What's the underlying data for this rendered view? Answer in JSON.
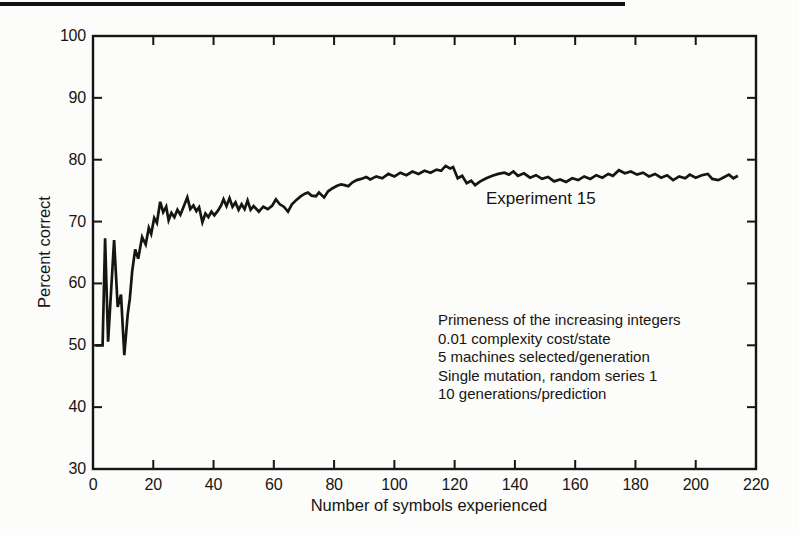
{
  "figure": {
    "ink_color": "#171513",
    "background_color": "#fcfcfa",
    "top_rule_color": "#101010"
  },
  "chart_data": {
    "type": "line",
    "title": "",
    "series_label": "Experiment 15",
    "xlabel": "Number of symbols experienced",
    "ylabel": "Percent correct",
    "xlim": [
      0,
      220
    ],
    "ylim": [
      30,
      100
    ],
    "x_ticks": [
      0,
      20,
      40,
      60,
      80,
      100,
      120,
      140,
      160,
      180,
      200,
      220
    ],
    "y_ticks": [
      30,
      40,
      50,
      60,
      70,
      80,
      90,
      100
    ],
    "grid": false,
    "legend": "none",
    "line_color": "#171513",
    "annotations": [
      "Primeness of the increasing integers",
      "0.01 complexity cost/state",
      "5 machines selected/generation",
      "Single mutation, random series 1",
      "10 generations/prediction"
    ],
    "series": [
      {
        "name": "Experiment 15",
        "points": [
          [
            0.8,
            50
          ],
          [
            3.2,
            50
          ],
          [
            4,
            67.3
          ],
          [
            5,
            50.6
          ],
          [
            7,
            67
          ],
          [
            8.2,
            56.2
          ],
          [
            9.3,
            58.2
          ],
          [
            10.4,
            48.4
          ],
          [
            11.5,
            55
          ],
          [
            12.2,
            57.5
          ],
          [
            13,
            62
          ],
          [
            14,
            65.5
          ],
          [
            15,
            64
          ],
          [
            16.3,
            67.5
          ],
          [
            17.5,
            66.3
          ],
          [
            18.5,
            69
          ],
          [
            19.3,
            68
          ],
          [
            20.3,
            70.6
          ],
          [
            21.2,
            69.8
          ],
          [
            22.3,
            73.2
          ],
          [
            23.3,
            71.5
          ],
          [
            24.3,
            72.4
          ],
          [
            25.1,
            70.2
          ],
          [
            26,
            71.4
          ],
          [
            27,
            70.7
          ],
          [
            28,
            71.9
          ],
          [
            29,
            71.1
          ],
          [
            30,
            72.3
          ],
          [
            31.3,
            73.9
          ],
          [
            32.3,
            72
          ],
          [
            33.3,
            72.6
          ],
          [
            34.3,
            71.7
          ],
          [
            35.2,
            72.3
          ],
          [
            36.3,
            69.9
          ],
          [
            37.3,
            71.3
          ],
          [
            38.3,
            70.7
          ],
          [
            39.3,
            71.6
          ],
          [
            40.3,
            71
          ],
          [
            41.5,
            71.8
          ],
          [
            42.5,
            72.6
          ],
          [
            43.3,
            73.6
          ],
          [
            44.3,
            72.5
          ],
          [
            45.3,
            73.8
          ],
          [
            46.3,
            72.4
          ],
          [
            47.3,
            73.1
          ],
          [
            48.3,
            71.9
          ],
          [
            49.3,
            72.8
          ],
          [
            50.3,
            72
          ],
          [
            51.3,
            73.4
          ],
          [
            52.3,
            71.9
          ],
          [
            53.3,
            72.5
          ],
          [
            54.3,
            72
          ],
          [
            55,
            71.6
          ],
          [
            56.5,
            72.4
          ],
          [
            58,
            72
          ],
          [
            59.5,
            72.6
          ],
          [
            60.7,
            73.6
          ],
          [
            62,
            72.8
          ],
          [
            63.3,
            72.4
          ],
          [
            64.7,
            71.6
          ],
          [
            66,
            72.8
          ],
          [
            67.5,
            73.5
          ],
          [
            69,
            74.1
          ],
          [
            70.3,
            74.5
          ],
          [
            71.3,
            74.7
          ],
          [
            72.5,
            74.2
          ],
          [
            74,
            74.1
          ],
          [
            75,
            74.7
          ],
          [
            76.7,
            73.9
          ],
          [
            78,
            74.9
          ],
          [
            79.5,
            75.4
          ],
          [
            81,
            75.8
          ],
          [
            82.3,
            76
          ],
          [
            83.5,
            75.9
          ],
          [
            84.7,
            75.7
          ],
          [
            86,
            76.3
          ],
          [
            87.5,
            76.7
          ],
          [
            89,
            76.9
          ],
          [
            90.7,
            77.2
          ],
          [
            92,
            76.8
          ],
          [
            94,
            77.3
          ],
          [
            96,
            77
          ],
          [
            98,
            77.7
          ],
          [
            100,
            77.3
          ],
          [
            102,
            77.9
          ],
          [
            104,
            77.5
          ],
          [
            106,
            78.1
          ],
          [
            108,
            77.7
          ],
          [
            110,
            78.2
          ],
          [
            112,
            77.9
          ],
          [
            114,
            78.4
          ],
          [
            115.5,
            78.2
          ],
          [
            117,
            79
          ],
          [
            118.5,
            78.6
          ],
          [
            119.5,
            78.8
          ],
          [
            121,
            77
          ],
          [
            122.5,
            77.4
          ],
          [
            124,
            76.2
          ],
          [
            125.5,
            76.6
          ],
          [
            126.8,
            75.9
          ],
          [
            128.5,
            76.5
          ],
          [
            130.5,
            77
          ],
          [
            132.5,
            77.4
          ],
          [
            134.5,
            77.7
          ],
          [
            136.5,
            77.9
          ],
          [
            138,
            77.6
          ],
          [
            139.5,
            78.1
          ],
          [
            141,
            77.4
          ],
          [
            143,
            77.8
          ],
          [
            145,
            77.1
          ],
          [
            147,
            77.5
          ],
          [
            149,
            76.9
          ],
          [
            151,
            77.2
          ],
          [
            153,
            76.5
          ],
          [
            155,
            76.8
          ],
          [
            157,
            76.4
          ],
          [
            159,
            77
          ],
          [
            161,
            76.7
          ],
          [
            163,
            77.3
          ],
          [
            165,
            76.9
          ],
          [
            167,
            77.5
          ],
          [
            169,
            77.1
          ],
          [
            171,
            77.7
          ],
          [
            172.5,
            77.4
          ],
          [
            174.5,
            78.3
          ],
          [
            176.5,
            77.8
          ],
          [
            178.5,
            78.1
          ],
          [
            180.5,
            77.6
          ],
          [
            182.5,
            77.9
          ],
          [
            184.5,
            77.3
          ],
          [
            186.5,
            77.7
          ],
          [
            188.5,
            77.1
          ],
          [
            190.5,
            77.5
          ],
          [
            192.5,
            76.7
          ],
          [
            194.5,
            77.3
          ],
          [
            196.5,
            77
          ],
          [
            198,
            77.6
          ],
          [
            200,
            77.1
          ],
          [
            202,
            77.5
          ],
          [
            204,
            77.7
          ],
          [
            205.5,
            76.9
          ],
          [
            207.5,
            76.7
          ],
          [
            209.5,
            77.2
          ],
          [
            211,
            77.6
          ],
          [
            212.5,
            77
          ],
          [
            214,
            77.4
          ]
        ]
      }
    ]
  }
}
